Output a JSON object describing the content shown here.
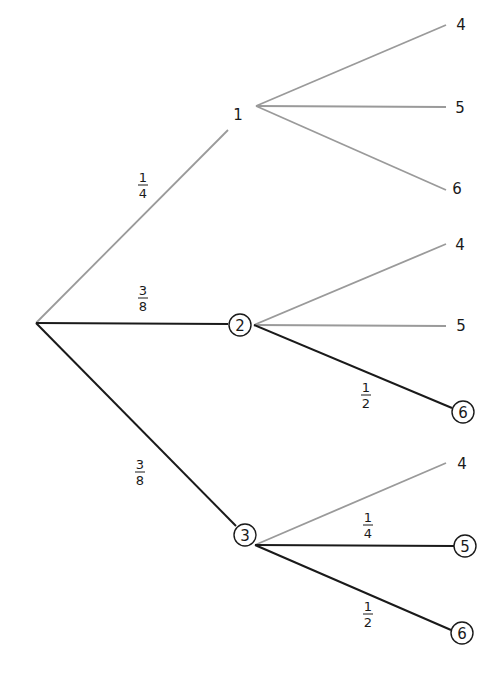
{
  "diagram": {
    "type": "probability-tree",
    "colors": {
      "highlight": "#1a1a1a",
      "muted": "#9a9a9a",
      "text": "#1a1a1a"
    },
    "root": {
      "x": 36,
      "y": 323
    },
    "level1": [
      {
        "id": "n1",
        "label": "1",
        "circled": false,
        "x": 238,
        "y": 114,
        "edge_end": [
          228,
          130
        ],
        "branch_origin": [
          256,
          106
        ],
        "highlight": false,
        "prob": {
          "num": "1",
          "den": "4",
          "x": 143,
          "y": 185
        }
      },
      {
        "id": "n2",
        "label": "2",
        "circled": true,
        "x": 240,
        "y": 325,
        "edge_end": [
          228,
          324
        ],
        "branch_origin": [
          254,
          325
        ],
        "highlight": true,
        "prob": {
          "num": "3",
          "den": "8",
          "x": 143,
          "y": 298
        }
      },
      {
        "id": "n3",
        "label": "3",
        "circled": true,
        "x": 245,
        "y": 535,
        "edge_end": [
          236,
          526
        ],
        "branch_origin": [
          255,
          545
        ],
        "highlight": true,
        "prob": {
          "num": "3",
          "den": "8",
          "x": 140,
          "y": 472
        }
      }
    ],
    "level2": [
      {
        "parent": "n1",
        "label": "4",
        "circled": false,
        "x": 461,
        "y": 24,
        "edge_end": [
          446,
          25
        ],
        "highlight": false,
        "prob": null
      },
      {
        "parent": "n1",
        "label": "5",
        "circled": false,
        "x": 460,
        "y": 107,
        "edge_end": [
          446,
          107
        ],
        "highlight": false,
        "prob": null
      },
      {
        "parent": "n1",
        "label": "6",
        "circled": false,
        "x": 457,
        "y": 188,
        "edge_end": [
          446,
          190
        ],
        "highlight": false,
        "prob": null
      },
      {
        "parent": "n2",
        "label": "4",
        "circled": false,
        "x": 460,
        "y": 244,
        "edge_end": [
          446,
          244
        ],
        "highlight": false,
        "prob": null
      },
      {
        "parent": "n2",
        "label": "5",
        "circled": false,
        "x": 461,
        "y": 325,
        "edge_end": [
          446,
          326
        ],
        "highlight": false,
        "prob": null
      },
      {
        "parent": "n2",
        "label": "6",
        "circled": true,
        "x": 463,
        "y": 412,
        "edge_end": [
          452,
          408
        ],
        "highlight": true,
        "prob": {
          "num": "1",
          "den": "2",
          "x": 366,
          "y": 395
        }
      },
      {
        "parent": "n3",
        "label": "4",
        "circled": false,
        "x": 462,
        "y": 463,
        "edge_end": [
          446,
          463
        ],
        "highlight": false,
        "prob": null
      },
      {
        "parent": "n3",
        "label": "5",
        "circled": true,
        "x": 465,
        "y": 546,
        "edge_end": [
          454,
          546
        ],
        "highlight": true,
        "prob": {
          "num": "1",
          "den": "4",
          "x": 368,
          "y": 525
        }
      },
      {
        "parent": "n3",
        "label": "6",
        "circled": true,
        "x": 462,
        "y": 633,
        "edge_end": [
          451,
          630
        ],
        "highlight": true,
        "prob": {
          "num": "1",
          "den": "2",
          "x": 368,
          "y": 614
        }
      }
    ]
  }
}
